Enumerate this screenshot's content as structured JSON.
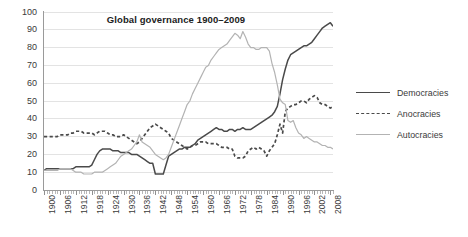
{
  "chart_data": {
    "type": "line",
    "title": "Global governance 1900–2009",
    "xlabel": "",
    "ylabel": "",
    "xlim": [
      1900,
      2009
    ],
    "ylim": [
      0,
      100
    ],
    "grid": true,
    "legend_position": "right",
    "yticks": [
      0,
      10,
      20,
      30,
      40,
      50,
      60,
      70,
      80,
      90,
      100
    ],
    "ytick_labels": [
      "0",
      "10",
      "20",
      "30",
      "40",
      "50",
      "60",
      "70",
      "80",
      "90",
      "100"
    ],
    "xticks": [
      1900,
      1906,
      1912,
      1918,
      1924,
      1930,
      1936,
      1942,
      1948,
      1954,
      1960,
      1966,
      1972,
      1978,
      1984,
      1990,
      1996,
      2002,
      2008
    ],
    "xtick_labels": [
      "1900",
      "1906",
      "1912",
      "1918",
      "1924",
      "1930",
      "1936",
      "1942",
      "1948",
      "1954",
      "1960",
      "1966",
      "1972",
      "1978",
      "1984",
      "1990",
      "1996",
      "2002",
      "2008"
    ],
    "x": [
      1900,
      1901,
      1902,
      1903,
      1904,
      1905,
      1906,
      1907,
      1908,
      1909,
      1910,
      1911,
      1912,
      1913,
      1914,
      1915,
      1916,
      1917,
      1918,
      1919,
      1920,
      1921,
      1922,
      1923,
      1924,
      1925,
      1926,
      1927,
      1928,
      1929,
      1930,
      1931,
      1932,
      1933,
      1934,
      1935,
      1936,
      1937,
      1938,
      1939,
      1940,
      1941,
      1942,
      1943,
      1944,
      1945,
      1946,
      1947,
      1948,
      1949,
      1950,
      1951,
      1952,
      1953,
      1954,
      1955,
      1956,
      1957,
      1958,
      1959,
      1960,
      1961,
      1962,
      1963,
      1964,
      1965,
      1966,
      1967,
      1968,
      1969,
      1970,
      1971,
      1972,
      1973,
      1974,
      1975,
      1976,
      1977,
      1978,
      1979,
      1980,
      1981,
      1982,
      1983,
      1984,
      1985,
      1986,
      1987,
      1988,
      1989,
      1990,
      1991,
      1992,
      1993,
      1994,
      1995,
      1996,
      1997,
      1998,
      1999,
      2000,
      2001,
      2002,
      2003,
      2004,
      2005,
      2006,
      2007,
      2008,
      2009
    ],
    "series": [
      {
        "name": "Democracies",
        "style": "solid",
        "color": "#4a4a4a",
        "values": [
          11,
          12,
          12,
          12,
          12,
          12,
          12,
          12,
          12,
          12,
          12,
          12,
          13,
          13,
          13,
          13,
          13,
          13,
          14,
          17,
          20,
          22,
          23,
          23,
          23,
          23,
          22,
          22,
          22,
          21,
          21,
          21,
          21,
          20,
          20,
          20,
          19,
          18,
          17,
          16,
          15,
          15,
          9,
          9,
          9,
          9,
          14,
          19,
          20,
          21,
          22,
          23,
          23,
          24,
          24,
          24,
          25,
          26,
          28,
          29,
          30,
          31,
          32,
          33,
          34,
          35,
          34,
          34,
          33,
          33,
          34,
          34,
          33,
          34,
          34,
          35,
          34,
          34,
          34,
          35,
          36,
          37,
          38,
          39,
          40,
          41,
          42,
          44,
          47,
          54,
          62,
          68,
          73,
          76,
          77,
          78,
          79,
          80,
          81,
          81,
          82,
          83,
          85,
          87,
          89,
          91,
          92,
          93,
          94,
          92
        ]
      },
      {
        "name": "Anocracies",
        "style": "dashed",
        "color": "#4a4a4a",
        "values": [
          30,
          30,
          30,
          30,
          30,
          30,
          31,
          31,
          31,
          31,
          32,
          32,
          33,
          33,
          33,
          32,
          32,
          32,
          32,
          31,
          32,
          33,
          33,
          33,
          32,
          31,
          31,
          30,
          30,
          30,
          31,
          30,
          29,
          28,
          27,
          26,
          27,
          29,
          31,
          33,
          35,
          36,
          37,
          36,
          35,
          34,
          33,
          32,
          29,
          28,
          27,
          26,
          25,
          24,
          23,
          24,
          25,
          25,
          26,
          27,
          27,
          27,
          26,
          26,
          26,
          26,
          25,
          24,
          24,
          24,
          23,
          23,
          19,
          18,
          18,
          18,
          19,
          22,
          23,
          24,
          23,
          24,
          23,
          22,
          19,
          22,
          24,
          26,
          31,
          37,
          32,
          44,
          46,
          47,
          48,
          48,
          49,
          50,
          50,
          49,
          51,
          52,
          53,
          52,
          49,
          48,
          48,
          47,
          46,
          47
        ]
      },
      {
        "name": "Autocracies",
        "style": "solid",
        "color": "#b3b3b3",
        "values": [
          11,
          11,
          11,
          11,
          11,
          11,
          12,
          12,
          12,
          12,
          12,
          11,
          10,
          10,
          10,
          9,
          9,
          9,
          9,
          10,
          10,
          10,
          10,
          11,
          12,
          13,
          14,
          15,
          17,
          19,
          20,
          21,
          22,
          23,
          25,
          27,
          31,
          27,
          26,
          25,
          24,
          22,
          20,
          19,
          18,
          17,
          18,
          20,
          24,
          28,
          32,
          36,
          40,
          44,
          48,
          50,
          54,
          57,
          60,
          63,
          66,
          69,
          70,
          73,
          75,
          77,
          79,
          80,
          81,
          82,
          84,
          86,
          88,
          87,
          85,
          89,
          86,
          82,
          80,
          80,
          79,
          79,
          80,
          80,
          80,
          78,
          71,
          66,
          59,
          51,
          49,
          48,
          39,
          38,
          39,
          35,
          32,
          31,
          29,
          30,
          29,
          28,
          27,
          27,
          26,
          25,
          25,
          24,
          24,
          23
        ]
      }
    ]
  },
  "legend": {
    "items": [
      {
        "label": "Democracies"
      },
      {
        "label": "Anocracies"
      },
      {
        "label": "Autocracies"
      }
    ]
  }
}
